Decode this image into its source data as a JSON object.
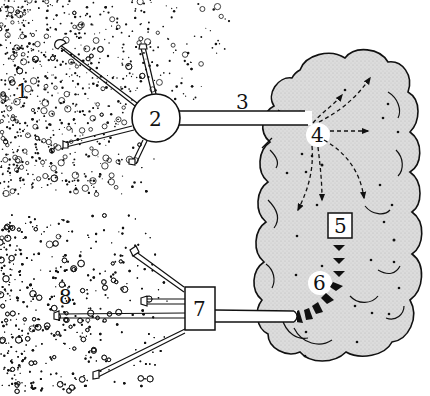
{
  "diagram": {
    "colors": {
      "ink": "#111111",
      "cloud_fill": "#d6d6d6",
      "background": "#ffffff",
      "tube_fill": "#ffffff"
    },
    "labels": {
      "region_source": "1",
      "hub": "2",
      "trunk": "3",
      "entry_point": "4",
      "inner_box": "5",
      "exit_point": "6",
      "outlet_box": "7",
      "region_target": "8"
    },
    "elements": [
      {
        "id": "1",
        "kind": "speckled-region",
        "position": "upper-left"
      },
      {
        "id": "2",
        "kind": "circle-hub",
        "branches": 4
      },
      {
        "id": "3",
        "kind": "tube",
        "connects": [
          "2",
          "cloud"
        ]
      },
      {
        "id": "4",
        "kind": "white-spot",
        "arrows": "dashed radiating"
      },
      {
        "id": "5",
        "kind": "square-box",
        "inside": "cloud"
      },
      {
        "id": "6",
        "kind": "white-spot",
        "chain": "dark diamond chain"
      },
      {
        "id": "7",
        "kind": "square-box",
        "branches": 4
      },
      {
        "id": "8",
        "kind": "speckled-region",
        "position": "lower-left"
      }
    ]
  }
}
